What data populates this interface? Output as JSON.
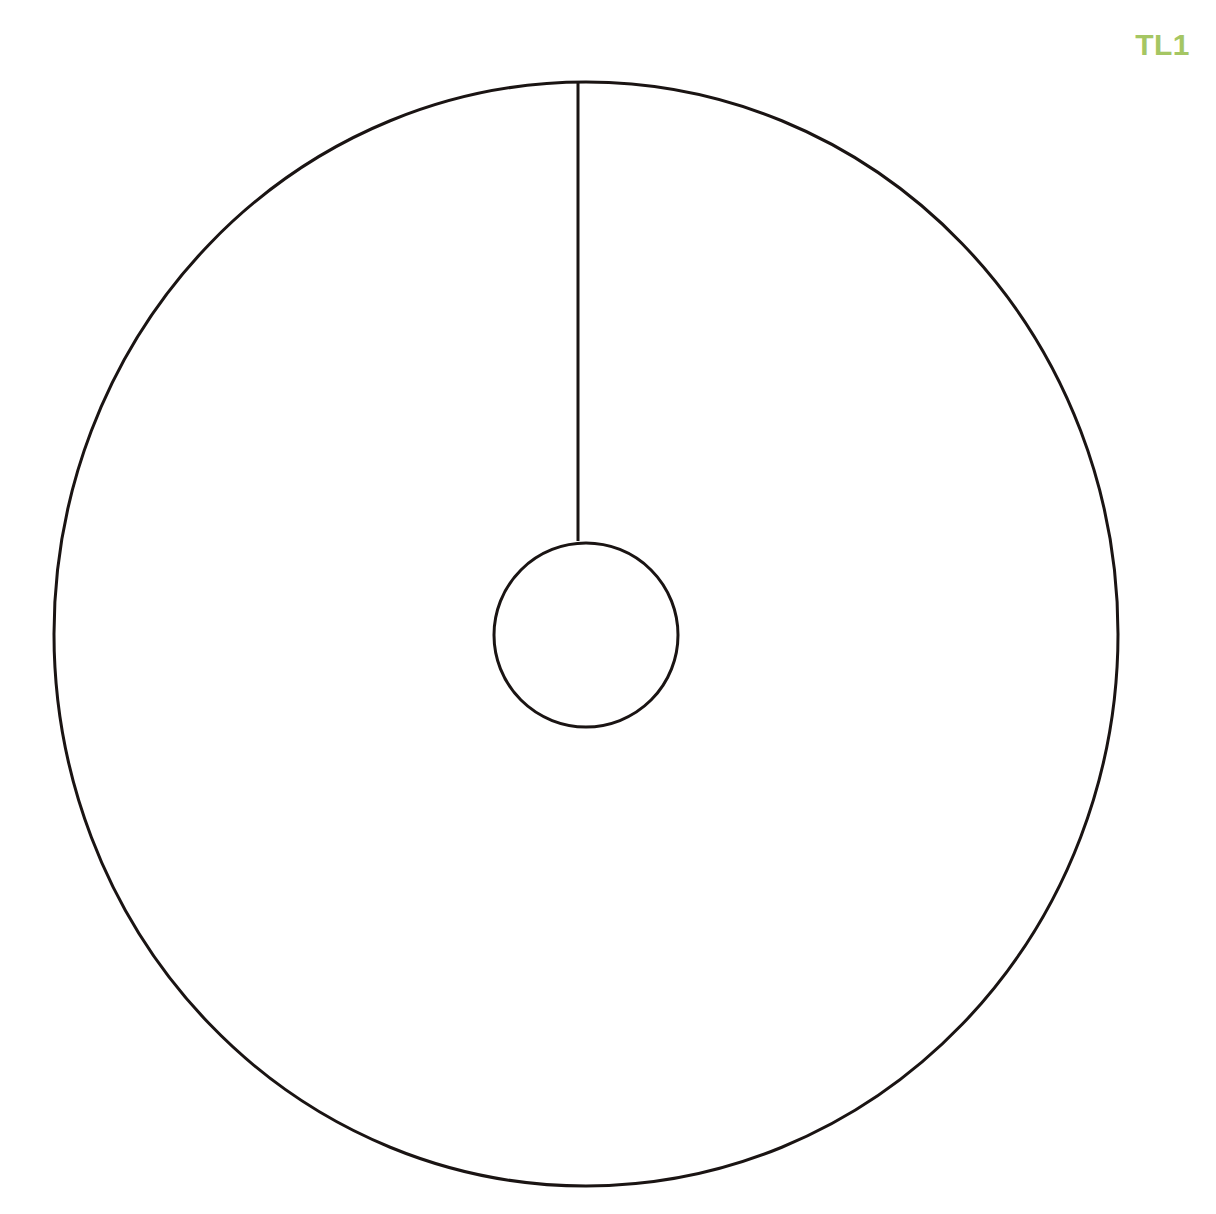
{
  "page": {
    "width": 1216,
    "height": 1214,
    "background_color": "#ffffff"
  },
  "labels": {
    "view_label": "TL1",
    "view_label_color": "#a5c663"
  },
  "drawing": {
    "stroke_color": "#1a1413",
    "fill_color": "none",
    "outer_circle": {
      "name": "outer-circle",
      "cx": 586,
      "cy": 634,
      "rx": 532,
      "ry": 552,
      "stroke_width": 3
    },
    "inner_circle": {
      "name": "inner-circle",
      "cx": 586,
      "cy": 635,
      "r": 92,
      "stroke_width": 3
    },
    "radius_line": {
      "name": "radius-line",
      "x1": 578,
      "y1": 82,
      "x2": 578,
      "y2": 541,
      "stroke_width": 3
    }
  }
}
